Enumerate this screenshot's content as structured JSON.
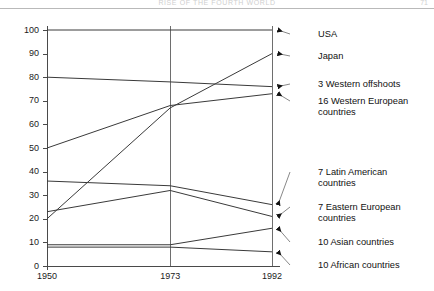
{
  "folio": {
    "running_head": "RISE OF THE FOURTH WORLD",
    "page_number": "71"
  },
  "chart_data": {
    "type": "line",
    "title": "",
    "subtitle": "",
    "xlabel": "",
    "ylabel": "",
    "x": [
      "1950",
      "1973",
      "1992"
    ],
    "xtick_labels": [
      "1950",
      "1973",
      "1992"
    ],
    "ytick_labels": [
      "0",
      "10",
      "20",
      "30",
      "40",
      "50",
      "60",
      "70",
      "80",
      "90",
      "100"
    ],
    "ytick_values": [
      0,
      10,
      20,
      30,
      40,
      50,
      60,
      70,
      80,
      90,
      100
    ],
    "ylim": [
      0,
      100
    ],
    "grid": "vertical-only",
    "legend_position": "right-callouts",
    "series": [
      {
        "name": "USA",
        "values": [
          100,
          100,
          100
        ]
      },
      {
        "name": "Japan",
        "values": [
          20,
          67,
          90
        ]
      },
      {
        "name": "3 Western offshoots",
        "values": [
          80,
          78,
          76
        ]
      },
      {
        "name": "16 Western European countries",
        "values": [
          50,
          68,
          73
        ]
      },
      {
        "name": "7 Latin American countries",
        "values": [
          36,
          34,
          26
        ]
      },
      {
        "name": "7 Eastern European countries",
        "values": [
          23,
          32,
          21
        ]
      },
      {
        "name": "10 Asian countries",
        "values": [
          9,
          9,
          16
        ]
      },
      {
        "name": "10 African countries",
        "values": [
          8,
          8,
          6
        ]
      }
    ]
  },
  "callouts": [
    {
      "id": "usa",
      "label": "USA"
    },
    {
      "id": "japan",
      "label": "Japan"
    },
    {
      "id": "western-offshoots",
      "label": "3 Western offshoots"
    },
    {
      "id": "western-european",
      "label": "16 Western European\ncountries"
    },
    {
      "id": "latin-american",
      "label": "7 Latin American\ncountries"
    },
    {
      "id": "eastern-european",
      "label": "7 Eastern European\ncountries"
    },
    {
      "id": "asian",
      "label": "10 Asian countries"
    },
    {
      "id": "african",
      "label": "10 African countries"
    }
  ]
}
